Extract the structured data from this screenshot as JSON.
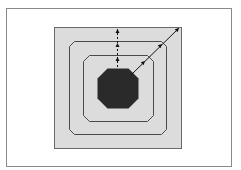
{
  "diagram": {
    "type": "nested-octagon-propagation",
    "colors": {
      "background": "#ffffff",
      "frame": "#8a8a8a",
      "outer_square_fill": "#dcdcdc",
      "outer_square_stroke": "#6a6a6a",
      "contour_stroke": "#4a4a4a",
      "core_fill": "#2a2a2a",
      "arrow": "#111111"
    },
    "shapes": {
      "frame": {
        "x": 6,
        "y": 8,
        "w": 225,
        "h": 158
      },
      "outer_square": {
        "x": 54,
        "y": 27,
        "w": 127,
        "h": 121
      },
      "middle_octagon": {
        "x": 69,
        "y": 41,
        "w": 97,
        "h": 93,
        "cut": 5
      },
      "inner_octagon": {
        "x": 83,
        "y": 55,
        "w": 70,
        "h": 66,
        "cut": 6
      },
      "core_octagon": {
        "x": 97,
        "y": 68,
        "w": 41,
        "h": 40,
        "cut": 10
      }
    },
    "arrows": {
      "vertical": {
        "x": 117,
        "y_start": 67,
        "y_end": 28,
        "heads_at": [
          57,
          43,
          29
        ]
      },
      "diagonal": {
        "x1": 131,
        "y1": 75,
        "x2": 179,
        "y2": 28,
        "heads_at": [
          [
            145,
            61
          ],
          [
            162,
            44
          ],
          [
            179,
            28
          ]
        ]
      }
    }
  }
}
